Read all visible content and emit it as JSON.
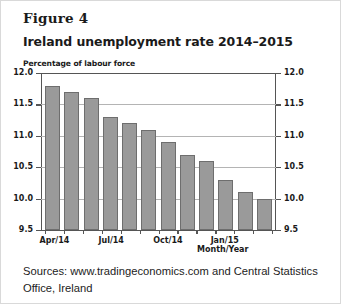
{
  "figure_label": "Figure 4",
  "title": "Ireland unemployment rate 2014–2015",
  "y_axis_note": "Percentage of labour force",
  "x_axis_title": "Month/Year",
  "sources": "Sources: www.tradingeconomics.com and Central Statistics Office, Ireland",
  "chart_data": {
    "type": "bar",
    "title": "Ireland unemployment rate 2014–2015",
    "xlabel": "Month/Year",
    "ylabel": "Percentage of labour force",
    "ylim": [
      9.5,
      12.0
    ],
    "ytick_labels": [
      "12.0",
      "11.5",
      "11.0",
      "10.5",
      "10.0",
      "9.5"
    ],
    "ytick_values": [
      12.0,
      11.5,
      11.0,
      10.5,
      10.0,
      9.5
    ],
    "right_axis_labels": [
      "12.0",
      "11.5",
      "11.0",
      "10.5",
      "10.0",
      "9.5"
    ],
    "grid": true,
    "legend": "none",
    "bar_color": "#9a9a9a",
    "bar_edge_color": "#6e6e6e",
    "categories": [
      "Apr/14",
      "May/14",
      "Jun/14",
      "Jul/14",
      "Aug/14",
      "Sep/14",
      "Oct/14",
      "Nov/14",
      "Dec/14",
      "Jan/15",
      "Feb/15",
      "Mar/15"
    ],
    "values": [
      11.8,
      11.7,
      11.6,
      11.3,
      11.2,
      11.1,
      10.9,
      10.7,
      10.6,
      10.3,
      10.1,
      10.0
    ],
    "xtick_labels": [
      "Apr/14",
      "Jul/14",
      "Oct/14",
      "Jan/15"
    ],
    "xtick_label_indices": [
      0,
      3,
      6,
      9
    ]
  }
}
